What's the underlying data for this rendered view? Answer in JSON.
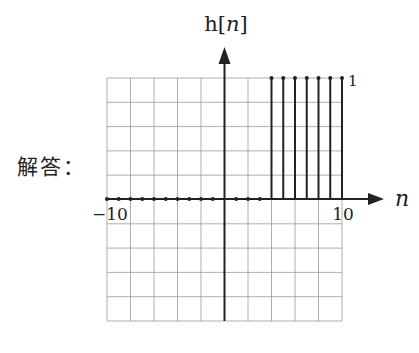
{
  "answer_label": "解答：",
  "chart_data": {
    "type": "stem",
    "title": "",
    "ylabel": "h[n]",
    "xlabel": "n",
    "xlim": [
      -10,
      10
    ],
    "ylim": [
      -5,
      5
    ],
    "grid": true,
    "x_tick_labels": [
      "-10",
      "10"
    ],
    "annotations": [
      {
        "text": "1",
        "x": 10,
        "y": 1
      }
    ],
    "x": [
      -10,
      -9,
      -8,
      -7,
      -6,
      -5,
      -4,
      -3,
      -2,
      -1,
      0,
      1,
      2,
      3,
      4,
      5,
      6,
      7,
      8,
      9,
      10
    ],
    "values": [
      0,
      0,
      0,
      0,
      0,
      0,
      0,
      0,
      0,
      0,
      0,
      0,
      0,
      0,
      1,
      1,
      1,
      1,
      1,
      1,
      1
    ]
  }
}
